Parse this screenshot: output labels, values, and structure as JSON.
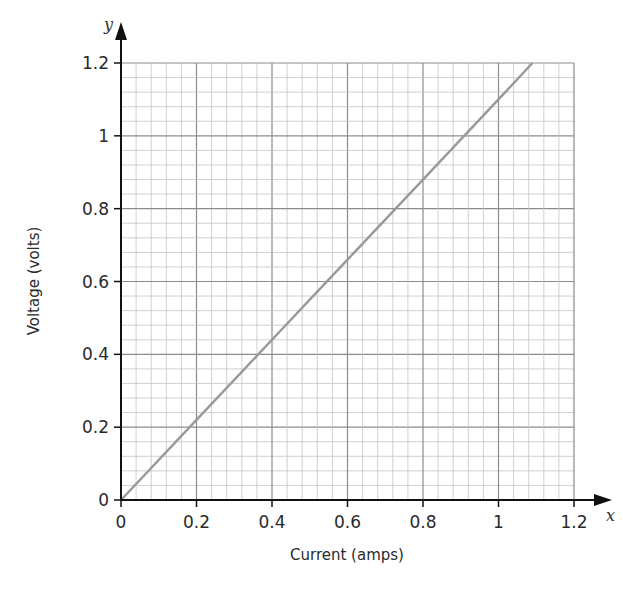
{
  "chart_data": {
    "type": "line",
    "title": "",
    "xlabel": "Current (amps)",
    "ylabel": "Voltage (volts)",
    "x_axis_var": "x",
    "y_axis_var": "y",
    "xlim": [
      0,
      1.2
    ],
    "ylim": [
      0,
      1.2
    ],
    "xticks": [
      "0",
      "0.2",
      "0.4",
      "0.6",
      "0.8",
      "1",
      "1.2"
    ],
    "yticks": [
      "0",
      "0.2",
      "0.4",
      "0.6",
      "0.8",
      "1",
      "1.2"
    ],
    "grid": {
      "on": true,
      "major_step": 0.2,
      "minor_step": 0.04
    },
    "series": [
      {
        "name": "Voltage vs Current",
        "color": "#9a9a9a",
        "x": [
          0,
          0.2,
          0.4,
          0.6,
          0.8,
          1.0,
          1.09
        ],
        "y": [
          0,
          0.22,
          0.44,
          0.66,
          0.88,
          1.1,
          1.2
        ]
      }
    ],
    "legend": null
  },
  "colors": {
    "axis": "#111111",
    "grid_major": "#8c8c8c",
    "grid_minor": "#c4c4c4",
    "line": "#9a9a9a"
  }
}
